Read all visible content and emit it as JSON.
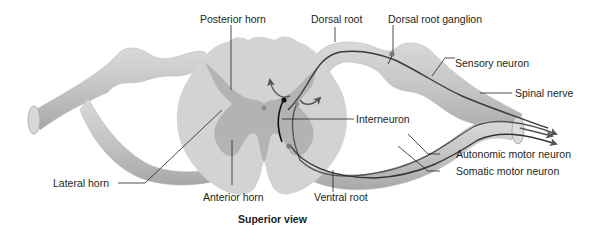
{
  "figure": {
    "caption": "Superior view",
    "colors": {
      "nerve_fill": "#c9c9c9",
      "nerve_shade": "#a9a9a9",
      "white_matter": "#d2d2d2",
      "gray_matter": "#b0b0b0",
      "neuron_line": "#3a3a3a",
      "interneuron": "#111111",
      "leader_line": "#231f20",
      "text": "#231f20"
    }
  },
  "labels": {
    "posterior_horn": "Posterior horn",
    "dorsal_root": "Dorsal root",
    "dorsal_root_ganglion": "Dorsal root ganglion",
    "sensory_neuron": "Sensory neuron",
    "spinal_nerve": "Spinal nerve",
    "interneuron": "Interneuron",
    "autonomic_motor_neuron": "Autonomic motor neuron",
    "somatic_motor_neuron": "Somatic motor neuron",
    "lateral_horn": "Lateral horn",
    "anterior_horn": "Anterior horn",
    "ventral_root": "Ventral root"
  }
}
